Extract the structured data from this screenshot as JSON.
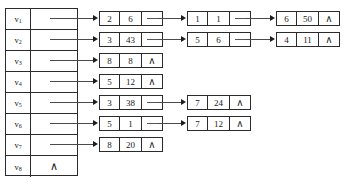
{
  "diagram": {
    "caption": "",
    "null_symbol": "∧",
    "link_symbol": "–",
    "colors": {
      "ink": "#2b2b2b",
      "line": "#4a4a4a",
      "background": "#ffffff"
    },
    "vertex_table": {
      "rows": [
        {
          "label": "v",
          "index": "1",
          "pointer": "",
          "has_list": true
        },
        {
          "label": "v",
          "index": "2",
          "pointer": "",
          "has_list": true
        },
        {
          "label": "v",
          "index": "3",
          "pointer": "",
          "has_list": true
        },
        {
          "label": "v",
          "index": "4",
          "pointer": "",
          "has_list": true
        },
        {
          "label": "v",
          "index": "5",
          "pointer": "",
          "has_list": true
        },
        {
          "label": "v",
          "index": "6",
          "pointer": "",
          "has_list": true
        },
        {
          "label": "v",
          "index": "7",
          "pointer": "",
          "has_list": true
        },
        {
          "label": "v",
          "index": "8",
          "pointer": "∧",
          "has_list": false
        }
      ]
    },
    "adjacency_lists": [
      {
        "vertex": "v1",
        "nodes": [
          {
            "vertex": "2",
            "weight": "6",
            "link": "–"
          },
          {
            "vertex": "1",
            "weight": "1",
            "link": "–"
          },
          {
            "vertex": "6",
            "weight": "50",
            "link": "∧"
          }
        ]
      },
      {
        "vertex": "v2",
        "nodes": [
          {
            "vertex": "3",
            "weight": "43",
            "link": "–"
          },
          {
            "vertex": "5",
            "weight": "6",
            "link": "–"
          },
          {
            "vertex": "4",
            "weight": "11",
            "link": "∧"
          }
        ]
      },
      {
        "vertex": "v3",
        "nodes": [
          {
            "vertex": "8",
            "weight": "8",
            "link": "∧"
          }
        ]
      },
      {
        "vertex": "v4",
        "nodes": [
          {
            "vertex": "5",
            "weight": "12",
            "link": "∧"
          }
        ]
      },
      {
        "vertex": "v5",
        "nodes": [
          {
            "vertex": "3",
            "weight": "38",
            "link": "–"
          },
          {
            "vertex": "7",
            "weight": "24",
            "link": "∧"
          }
        ]
      },
      {
        "vertex": "v6",
        "nodes": [
          {
            "vertex": "5",
            "weight": "1",
            "link": "–"
          },
          {
            "vertex": "7",
            "weight": "12",
            "link": "∧"
          }
        ]
      },
      {
        "vertex": "v7",
        "nodes": [
          {
            "vertex": "8",
            "weight": "20",
            "link": "∧"
          }
        ]
      },
      {
        "vertex": "v8",
        "nodes": []
      }
    ]
  }
}
